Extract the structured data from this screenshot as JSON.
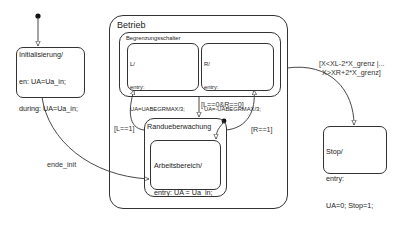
{
  "diagram": {
    "type": "stateflow-chart",
    "states": {
      "init": {
        "name": "Initialisierung/",
        "lines": [
          "en: UA=Ua_in;",
          "during: UA=Ua_in;"
        ]
      },
      "betrieb": {
        "name": "Betrieb"
      },
      "begrenzung": {
        "name": "Begrenzungsschalter"
      },
      "left": {
        "name": "L/",
        "lines": [
          "entry:",
          "UA=UABEGRMAX/3;"
        ]
      },
      "right": {
        "name": "R/",
        "lines": [
          "entry:",
          "UA=-UABEGRMAX/3;"
        ]
      },
      "rand": {
        "name": "Randueberwachung"
      },
      "arbeit": {
        "name": "Arbeitsbereich/",
        "lines": [
          "entry: UA = Ua_in;",
          "during: UA = Ua_in;"
        ]
      },
      "stop": {
        "name": "Stop/",
        "lines": [
          "entry:",
          "UA=0; Stop=1;"
        ]
      }
    },
    "transitions": {
      "ende_init": "ende_init",
      "to_rand": "[L==0&R==0]",
      "to_left": "[L==1]",
      "to_right": "[R==1]",
      "to_stop_1": "[X<XL-2*X_grenz |...",
      "to_stop_2": "X>XR+2*X_grenz]"
    },
    "colors": {
      "line": "#333333",
      "background": "#ffffff"
    }
  }
}
